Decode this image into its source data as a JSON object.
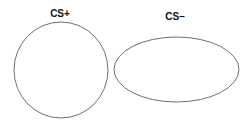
{
  "diagram": {
    "shapes": [
      {
        "id": "cs-plus",
        "label": "CS+",
        "type": "circle",
        "cx": 61,
        "cy": 70,
        "rx": 47,
        "ry": 48,
        "label_x": 60,
        "label_y": 17
      },
      {
        "id": "cs-minus",
        "label": "CS–",
        "type": "ellipse",
        "cx": 176.5,
        "cy": 69.5,
        "rx": 62.5,
        "ry": 32.5,
        "label_x": 175,
        "label_y": 20
      }
    ],
    "stroke_color": "#6e6e6e",
    "background": "#ffffff"
  }
}
